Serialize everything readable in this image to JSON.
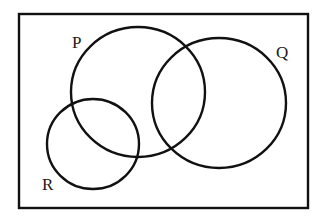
{
  "diagram": {
    "type": "venn",
    "stroke_color": "#111111",
    "background_color": "#ffffff",
    "universal_set": {
      "x": 19,
      "y": 14,
      "width": 289,
      "height": 194
    },
    "sets": [
      {
        "id": "P",
        "label": "P",
        "cx": 138,
        "cy": 92,
        "rx": 67,
        "ry": 65,
        "label_x": 72,
        "label_y": 48
      },
      {
        "id": "Q",
        "label": "Q",
        "cx": 219,
        "cy": 103,
        "rx": 67,
        "ry": 65,
        "label_x": 276,
        "label_y": 58
      },
      {
        "id": "R",
        "label": "R",
        "cx": 93,
        "cy": 144,
        "rx": 46,
        "ry": 45,
        "label_x": 42,
        "label_y": 190
      }
    ],
    "relationships": [
      "P overlaps Q",
      "P overlaps R",
      "Q and R are disjoint"
    ]
  }
}
